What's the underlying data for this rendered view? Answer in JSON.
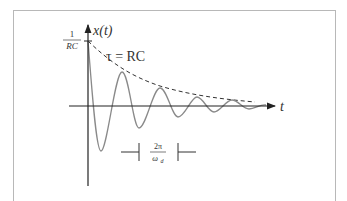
{
  "diagram": {
    "type": "damped-oscillation",
    "y_axis_label": "x(t)",
    "x_axis_label": "t",
    "initial_value_label": {
      "numerator": "1",
      "denominator": "RC"
    },
    "envelope_label": "τ = RC",
    "period_label": {
      "numerator": "2π",
      "denominator": "ω",
      "subscript": "d"
    },
    "colors": {
      "axis": "#222222",
      "curve": "#8a8a8a",
      "envelope": "#333333",
      "frame": "#b8b8b8"
    }
  }
}
